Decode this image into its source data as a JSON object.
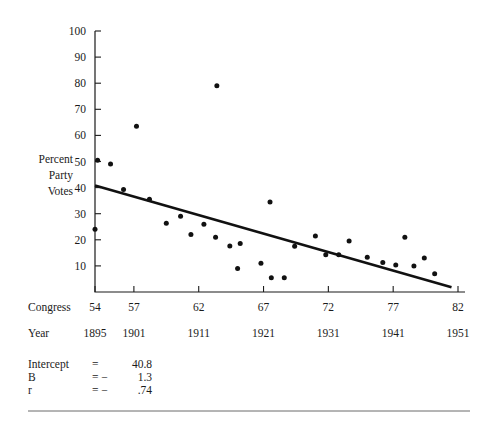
{
  "chart_data": {
    "type": "scatter",
    "title": "",
    "subtitle": "",
    "ylabel": "Percent Party Votes",
    "ylabel_lines": [
      "Percent",
      "Party",
      "Votes"
    ],
    "xlabel": "",
    "x_axis_rows": [
      {
        "name": "Congress",
        "label": "Congress",
        "ticks": [
          "54",
          "57",
          "62",
          "67",
          "72",
          "77",
          "82"
        ],
        "tick_values": [
          54,
          57,
          62,
          67,
          72,
          77,
          82
        ]
      },
      {
        "name": "Year",
        "label": "Year",
        "ticks": [
          "1895",
          "1901",
          "1911",
          "1921",
          "1931",
          "1941",
          "1951"
        ],
        "tick_values": [
          1895,
          1901,
          1911,
          1921,
          1931,
          1941,
          1951
        ]
      }
    ],
    "yticks": [
      "10",
      "20",
      "30",
      "40",
      "50",
      "60",
      "70",
      "80",
      "90",
      "100"
    ],
    "ytick_values": [
      10,
      20,
      30,
      40,
      50,
      60,
      70,
      80,
      90,
      100
    ],
    "ylim": [
      0,
      100
    ],
    "xlim": [
      54,
      82
    ],
    "grid": false,
    "legend": "none",
    "points": [
      {
        "x": 54.0,
        "y": 24.0
      },
      {
        "x": 54.2,
        "y": 50.5
      },
      {
        "x": 55.2,
        "y": 49.0
      },
      {
        "x": 57.2,
        "y": 63.5
      },
      {
        "x": 56.2,
        "y": 39.3
      },
      {
        "x": 58.2,
        "y": 35.5
      },
      {
        "x": 59.5,
        "y": 26.3
      },
      {
        "x": 60.6,
        "y": 29.0
      },
      {
        "x": 61.4,
        "y": 22.0
      },
      {
        "x": 62.4,
        "y": 26.0
      },
      {
        "x": 63.4,
        "y": 79.0
      },
      {
        "x": 63.3,
        "y": 21.0
      },
      {
        "x": 64.4,
        "y": 17.6
      },
      {
        "x": 65.2,
        "y": 18.6
      },
      {
        "x": 65.0,
        "y": 9.0
      },
      {
        "x": 66.8,
        "y": 11.0
      },
      {
        "x": 67.5,
        "y": 34.5
      },
      {
        "x": 67.6,
        "y": 5.5
      },
      {
        "x": 68.6,
        "y": 5.5
      },
      {
        "x": 69.4,
        "y": 17.5
      },
      {
        "x": 71.0,
        "y": 21.5
      },
      {
        "x": 71.8,
        "y": 14.3
      },
      {
        "x": 72.8,
        "y": 14.3
      },
      {
        "x": 73.6,
        "y": 19.5
      },
      {
        "x": 75.0,
        "y": 13.3
      },
      {
        "x": 76.2,
        "y": 11.3
      },
      {
        "x": 77.2,
        "y": 10.3
      },
      {
        "x": 77.9,
        "y": 21.0
      },
      {
        "x": 78.6,
        "y": 10.0
      },
      {
        "x": 79.4,
        "y": 13.0
      },
      {
        "x": 80.2,
        "y": 7.0
      }
    ],
    "fit_line": {
      "name": "regression-line",
      "x_start": 54.0,
      "y_start": 40.8,
      "x_end": 81.5,
      "y_end": 1.8
    }
  },
  "stats": {
    "rows": [
      {
        "label": "Intercept",
        "equals": "=",
        "value": "40.8"
      },
      {
        "label": "B",
        "equals": "= −",
        "value": "1.3"
      },
      {
        "label": "r",
        "equals": "= −",
        "value": ".74"
      }
    ]
  },
  "colors": {
    "ink": "#1b1b1b",
    "marker": "#111111",
    "line": "#111111",
    "rule": "#5a5a5a",
    "background": "#ffffff"
  }
}
